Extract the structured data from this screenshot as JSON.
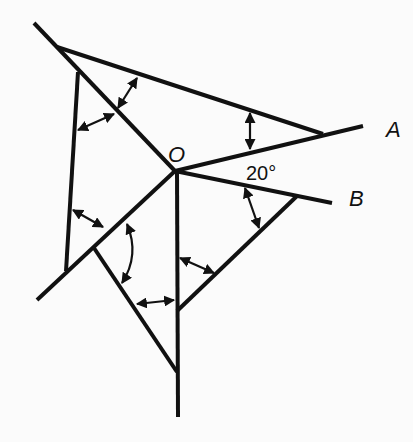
{
  "diagram": {
    "title": "",
    "labels": {
      "vertex": "O",
      "ray_a": "A",
      "ray_b": "B",
      "angle": "20°"
    },
    "colors": {
      "ink": "#111111",
      "background": "#fbfbfb"
    }
  }
}
